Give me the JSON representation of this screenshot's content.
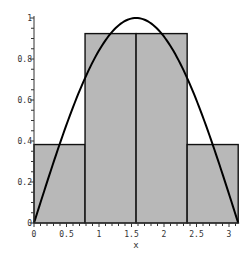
{
  "chart_data": {
    "type": "bar",
    "title": "",
    "xlabel": "x",
    "ylabel": "",
    "xlim": [
      0,
      3.1416
    ],
    "ylim": [
      0,
      1
    ],
    "grid": false,
    "legend": null,
    "bars": [
      {
        "x_start": 0,
        "x_end": 0.7854,
        "height": 0.3827
      },
      {
        "x_start": 0.7854,
        "x_end": 1.5708,
        "height": 0.9239
      },
      {
        "x_start": 1.5708,
        "x_end": 2.3562,
        "height": 0.9239
      },
      {
        "x_start": 2.3562,
        "x_end": 3.1416,
        "height": 0.3827
      }
    ],
    "curve": {
      "name": "sin(x)",
      "x_range": [
        0,
        3.1416
      ]
    },
    "x_ticks": [
      "0",
      "0.5",
      "1",
      "1.5",
      "2",
      "2.5",
      "3"
    ],
    "x_tick_values": [
      0,
      0.5,
      1,
      1.5,
      2,
      2.5,
      3
    ],
    "y_ticks": [
      "0",
      "0.2",
      "0.4",
      "0.6",
      "0.8",
      "1"
    ],
    "y_tick_values": [
      0,
      0.2,
      0.4,
      0.6,
      0.8,
      1
    ],
    "colors": {
      "bar_fill": "#b8b8b8",
      "bar_stroke": "#111111",
      "curve": "#000000",
      "axis": "#333333"
    }
  }
}
